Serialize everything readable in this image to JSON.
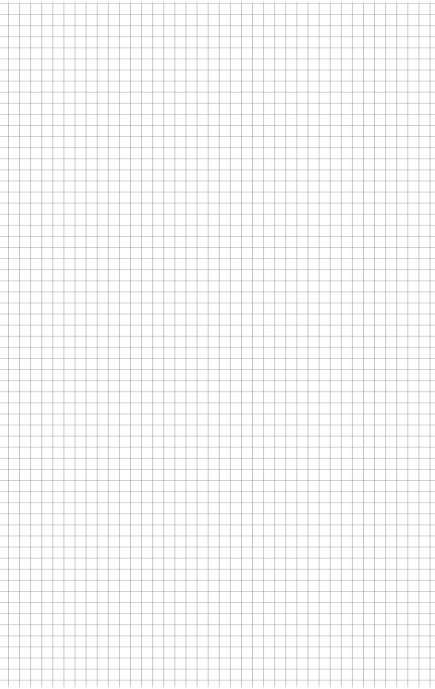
{
  "page": {
    "type": "graph-paper",
    "grid": {
      "cell_size_px": 11,
      "line_color": "#b0b0b0",
      "background_color": "#ffffff"
    }
  }
}
